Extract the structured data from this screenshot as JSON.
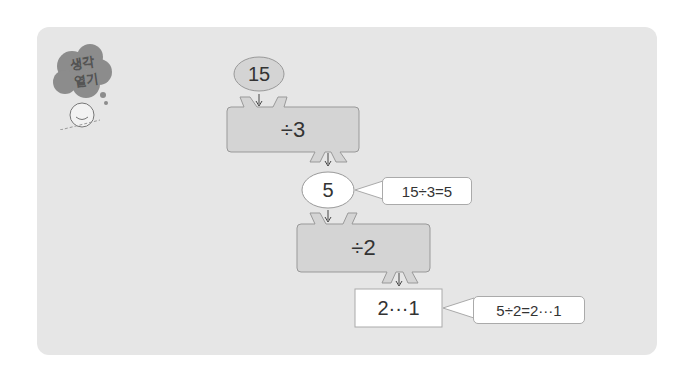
{
  "badge": {
    "line1": "생각",
    "line2": "열기"
  },
  "flow": {
    "start_value": "15",
    "step1_op": "÷3",
    "mid_value": "5",
    "step2_op": "÷2",
    "result_value": "2···1"
  },
  "notes": {
    "note1": "15÷3=5",
    "note2": "5÷2=2···1"
  },
  "colors": {
    "panel_bg": "#e6e6e6",
    "box_fill": "#d4d4d4",
    "badge_cloud": "#8c8c8c"
  }
}
